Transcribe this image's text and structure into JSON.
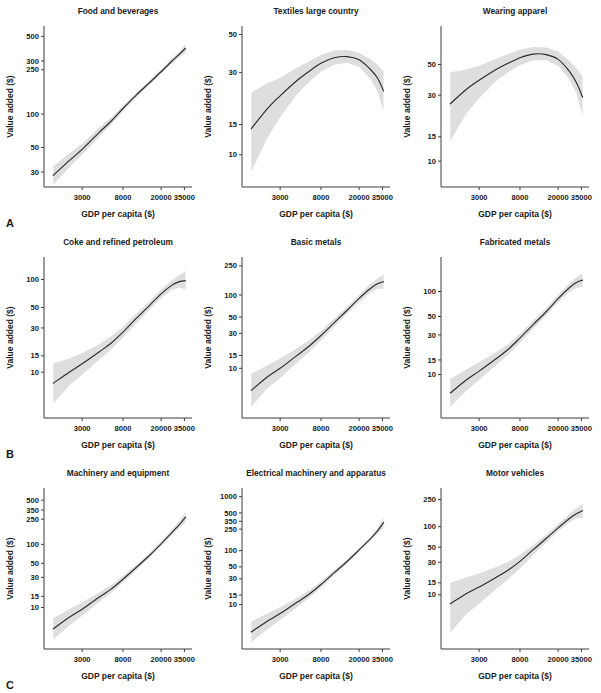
{
  "figure": {
    "axis_labels": {
      "x": "GDP per capita ($)",
      "y": "Value added ($)"
    },
    "colors": {
      "curve": "#2b2b2b",
      "band": "#dedede",
      "axis": "#3c3c3c",
      "text": "#1b1b1b",
      "background": "#ffffff"
    },
    "rows": [
      {
        "letter": "A"
      },
      {
        "letter": "B"
      },
      {
        "letter": "C"
      }
    ]
  },
  "chart_data": [
    {
      "type": "line",
      "panel": "A1",
      "title": "Food and beverages",
      "xlabel": "GDP per capita ($)",
      "ylabel": "Value added ($)",
      "xscale": "log",
      "yscale": "log",
      "xlim": [
        1200,
        42000
      ],
      "ylim": [
        22,
        620
      ],
      "xticks": [
        3000,
        8000,
        20000,
        35000
      ],
      "yticks": [
        30,
        50,
        100,
        250,
        300,
        500
      ],
      "grid": false,
      "legend": "none",
      "x": [
        1500,
        2200,
        3000,
        4500,
        6000,
        8000,
        11000,
        15000,
        20000,
        26000,
        31000,
        36000
      ],
      "y": [
        28,
        38,
        48,
        68,
        86,
        112,
        148,
        190,
        240,
        300,
        345,
        390
      ],
      "band_lower": [
        23,
        33,
        43,
        62,
        80,
        106,
        141,
        182,
        230,
        286,
        325,
        360
      ],
      "band_upper": [
        34,
        44,
        54,
        75,
        93,
        119,
        156,
        199,
        251,
        316,
        368,
        425
      ]
    },
    {
      "type": "line",
      "panel": "A2",
      "title": "Textiles large country",
      "xlabel": "GDP per capita ($)",
      "ylabel": "Value added ($)",
      "xscale": "log",
      "yscale": "log",
      "xlim": [
        1200,
        42000
      ],
      "ylim": [
        6.5,
        56
      ],
      "xticks": [
        3000,
        8000,
        20000,
        35000
      ],
      "yticks": [
        10,
        15,
        30,
        50
      ],
      "grid": false,
      "legend": "none",
      "x": [
        1500,
        2200,
        3000,
        4500,
        6000,
        8000,
        11000,
        15000,
        20000,
        26000,
        31000,
        36000
      ],
      "y": [
        14.2,
        18.5,
        22.0,
        27.0,
        30.5,
        34.0,
        36.6,
        37.2,
        35.6,
        31.5,
        28.0,
        23.5
      ],
      "band_lower": [
        8.0,
        12.5,
        16.5,
        22.5,
        26.5,
        30.5,
        33.4,
        34.2,
        32.4,
        27.8,
        23.5,
        18.0
      ],
      "band_upper": [
        23.0,
        26.0,
        28.0,
        32.0,
        34.8,
        38.0,
        40.3,
        40.6,
        39.2,
        36.0,
        33.5,
        30.5
      ]
    },
    {
      "type": "line",
      "panel": "A3",
      "title": "Wearing apparel",
      "xlabel": "GDP per capita ($)",
      "ylabel": "Value added ($)",
      "xscale": "log",
      "yscale": "log",
      "xlim": [
        1200,
        42000
      ],
      "ylim": [
        6.5,
        95
      ],
      "xticks": [
        3000,
        8000,
        20000,
        35000
      ],
      "yticks": [
        10,
        15,
        30,
        50
      ],
      "grid": false,
      "legend": "none",
      "x": [
        1500,
        2200,
        3000,
        4500,
        6000,
        8000,
        11000,
        15000,
        20000,
        26000,
        31000,
        36000
      ],
      "y": [
        26.0,
        33.0,
        38.5,
        46.0,
        51.0,
        56.0,
        59.5,
        59.0,
        54.5,
        45.0,
        37.0,
        29.0
      ],
      "band_lower": [
        14.0,
        22.0,
        28.5,
        38.0,
        44.0,
        49.5,
        53.8,
        53.6,
        49.0,
        39.5,
        31.0,
        21.5
      ],
      "band_upper": [
        44.0,
        46.0,
        49.0,
        55.0,
        59.5,
        64.0,
        67.0,
        66.5,
        62.0,
        53.5,
        47.0,
        41.0
      ]
    },
    {
      "type": "line",
      "panel": "B1",
      "title": "Coke and refined petroleum",
      "xlabel": "GDP per capita ($)",
      "ylabel": "Value added ($)",
      "xscale": "log",
      "yscale": "log",
      "xlim": [
        1200,
        42000
      ],
      "ylim": [
        3.2,
        175
      ],
      "xticks": [
        3000,
        8000,
        20000,
        35000
      ],
      "yticks": [
        10,
        15,
        30,
        50,
        100
      ],
      "grid": false,
      "legend": "none",
      "x": [
        1500,
        2200,
        3000,
        4500,
        6000,
        8000,
        11000,
        15000,
        20000,
        26000,
        31000,
        36000
      ],
      "y": [
        7.6,
        10.0,
        12.3,
        16.5,
        20.5,
        27.0,
        38.0,
        52.0,
        70.0,
        87.0,
        95.0,
        97.0
      ],
      "band_lower": [
        4.6,
        7.2,
        9.4,
        13.6,
        17.4,
        23.5,
        33.8,
        47.0,
        63.0,
        77.0,
        82.0,
        78.0
      ],
      "band_upper": [
        12.4,
        14.0,
        16.1,
        20.0,
        24.2,
        31.0,
        42.8,
        57.5,
        78.0,
        99.0,
        112.0,
        123.0
      ]
    },
    {
      "type": "line",
      "panel": "B2",
      "title": "Basic metals",
      "xlabel": "GDP per capita ($)",
      "ylabel": "Value added ($)",
      "xscale": "log",
      "yscale": "log",
      "xlim": [
        1200,
        42000
      ],
      "ylim": [
        2.1,
        330
      ],
      "xticks": [
        3000,
        8000,
        20000,
        35000
      ],
      "yticks": [
        10,
        15,
        30,
        50,
        100,
        250
      ],
      "grid": false,
      "legend": "none",
      "x": [
        1500,
        2200,
        3000,
        4500,
        6000,
        8000,
        11000,
        15000,
        20000,
        26000,
        31000,
        36000
      ],
      "y": [
        5.0,
        7.6,
        10.0,
        15.0,
        20.0,
        28.0,
        42.0,
        62.0,
        90.0,
        122.0,
        142.0,
        152.0
      ],
      "band_lower": [
        3.0,
        5.3,
        7.4,
        12.0,
        16.6,
        24.2,
        37.0,
        55.5,
        80.0,
        107.0,
        121.0,
        122.0
      ],
      "band_upper": [
        8.4,
        11.0,
        13.6,
        18.8,
        24.2,
        32.5,
        47.6,
        69.0,
        101.0,
        140.0,
        168.0,
        190.0
      ]
    },
    {
      "type": "line",
      "panel": "B3",
      "title": "Fabricated metals",
      "xlabel": "GDP per capita ($)",
      "ylabel": "Value added ($)",
      "xscale": "log",
      "yscale": "log",
      "xlim": [
        1200,
        42000
      ],
      "ylim": [
        3.0,
        260
      ],
      "xticks": [
        3000,
        8000,
        20000,
        35000
      ],
      "yticks": [
        10,
        15,
        30,
        50,
        100
      ],
      "grid": false,
      "legend": "none",
      "x": [
        1500,
        2200,
        3000,
        4500,
        6000,
        8000,
        11000,
        15000,
        20000,
        26000,
        31000,
        36000
      ],
      "y": [
        6.0,
        8.6,
        11.0,
        15.5,
        20.0,
        27.5,
        40.0,
        57.0,
        82.0,
        110.0,
        128.0,
        137.0
      ],
      "band_lower": [
        4.1,
        6.4,
        8.6,
        12.9,
        17.2,
        24.2,
        35.8,
        51.5,
        74.0,
        98.0,
        111.0,
        113.0
      ],
      "band_upper": [
        8.8,
        11.5,
        14.1,
        18.6,
        23.2,
        31.2,
        44.7,
        63.0,
        91.0,
        124.0,
        148.0,
        166.0
      ]
    },
    {
      "type": "line",
      "panel": "C1",
      "title": "Machinery and equipment",
      "xlabel": "GDP per capita ($)",
      "ylabel": "Value added ($)",
      "xscale": "log",
      "yscale": "log",
      "xlim": [
        1200,
        42000
      ],
      "ylim": [
        2.2,
        780
      ],
      "xticks": [
        3000,
        8000,
        20000,
        35000
      ],
      "yticks": [
        10,
        15,
        30,
        50,
        100,
        250,
        350,
        500
      ],
      "grid": false,
      "legend": "none",
      "x": [
        1500,
        2200,
        3000,
        4500,
        6000,
        8000,
        11000,
        15000,
        20000,
        26000,
        31000,
        36000
      ],
      "y": [
        4.6,
        7.0,
        9.4,
        14.5,
        19.5,
        28.0,
        43.0,
        66.0,
        102.0,
        155.0,
        205.0,
        270.0
      ],
      "band_lower": [
        3.1,
        5.2,
        7.4,
        12.2,
        17.0,
        25.0,
        39.0,
        60.5,
        94.0,
        141.0,
        182.0,
        224.0
      ],
      "band_upper": [
        6.8,
        9.4,
        12.0,
        17.2,
        22.4,
        31.4,
        47.4,
        72.0,
        111.0,
        171.0,
        234.0,
        330.0
      ]
    },
    {
      "type": "line",
      "panel": "C2",
      "title": "Electrical machinery and apparatus",
      "xlabel": "GDP per capita ($)",
      "ylabel": "Value added ($)",
      "xscale": "log",
      "yscale": "log",
      "xlim": [
        1200,
        42000
      ],
      "ylim": [
        1.5,
        1450
      ],
      "xticks": [
        3000,
        8000,
        20000,
        35000
      ],
      "yticks": [
        10,
        15,
        30,
        50,
        100,
        250,
        350,
        500,
        1000
      ],
      "grid": false,
      "legend": "none",
      "x": [
        1500,
        2200,
        3000,
        4500,
        6000,
        8000,
        11000,
        15000,
        20000,
        26000,
        31000,
        36000
      ],
      "y": [
        3.1,
        4.9,
        6.8,
        11.0,
        15.5,
        23.5,
        39.0,
        63.0,
        103.0,
        163.0,
        230.0,
        330.0
      ],
      "band_lower": [
        2.0,
        3.5,
        5.2,
        9.0,
        13.2,
        20.6,
        35.0,
        57.5,
        95.0,
        149.0,
        204.0,
        268.0
      ],
      "band_upper": [
        4.8,
        6.8,
        8.9,
        13.4,
        18.2,
        26.8,
        43.5,
        69.0,
        112.0,
        178.0,
        259.0,
        408.0
      ]
    },
    {
      "type": "line",
      "panel": "C3",
      "title": "Motor vehicles",
      "xlabel": "GDP per capita ($)",
      "ylabel": "Value added ($)",
      "xscale": "log",
      "yscale": "log",
      "xlim": [
        1200,
        42000
      ],
      "ylim": [
        1.6,
        370
      ],
      "xticks": [
        3000,
        8000,
        20000,
        35000
      ],
      "yticks": [
        10,
        15,
        30,
        50,
        100,
        250
      ],
      "grid": false,
      "legend": "none",
      "x": [
        1500,
        2200,
        3000,
        4500,
        6000,
        8000,
        11000,
        15000,
        20000,
        26000,
        31000,
        36000
      ],
      "y": [
        7.4,
        10.4,
        13.0,
        18.0,
        23.0,
        31.0,
        46.0,
        67.0,
        96.0,
        131.0,
        155.0,
        172.0
      ],
      "band_lower": [
        2.8,
        5.2,
        7.4,
        12.2,
        16.8,
        24.4,
        38.6,
        58.5,
        85.0,
        115.0,
        132.0,
        135.0
      ],
      "band_upper": [
        15.0,
        18.0,
        20.6,
        25.6,
        30.4,
        38.6,
        54.0,
        76.0,
        109.0,
        152.0,
        186.0,
        218.0
      ]
    }
  ]
}
